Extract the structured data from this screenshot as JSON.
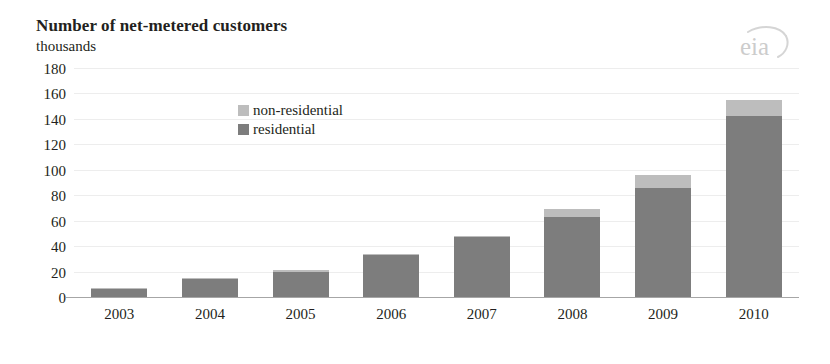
{
  "header": {
    "title": "Number of net-metered customers",
    "subtitle": "thousands",
    "logo_text": "eia"
  },
  "chart_data": {
    "type": "bar",
    "stacked": true,
    "title": "Number of net-metered customers",
    "subtitle": "thousands",
    "xlabel": "",
    "ylabel": "thousands",
    "ylim": [
      0,
      180
    ],
    "ytick_step": 20,
    "yticks": [
      180,
      160,
      140,
      120,
      100,
      80,
      60,
      40,
      20,
      0
    ],
    "categories": [
      "2003",
      "2004",
      "2005",
      "2006",
      "2007",
      "2008",
      "2009",
      "2010"
    ],
    "series": [
      {
        "name": "residential",
        "color": "#7d7d7d",
        "values": [
          6,
          14,
          20,
          33,
          47,
          63,
          86,
          142
        ]
      },
      {
        "name": "non-residential",
        "color": "#bdbdbd",
        "values": [
          1,
          1,
          1,
          1,
          1,
          6,
          10,
          13
        ]
      }
    ],
    "totals": [
      7,
      15,
      21,
      34,
      48,
      69,
      96,
      155
    ],
    "grid": true,
    "gridline_color": "#ededed",
    "legend_position": "inside-top-center"
  },
  "legend": {
    "items": [
      {
        "label": "non-residential",
        "color": "#bdbdbd"
      },
      {
        "label": "residential",
        "color": "#7d7d7d"
      }
    ]
  }
}
